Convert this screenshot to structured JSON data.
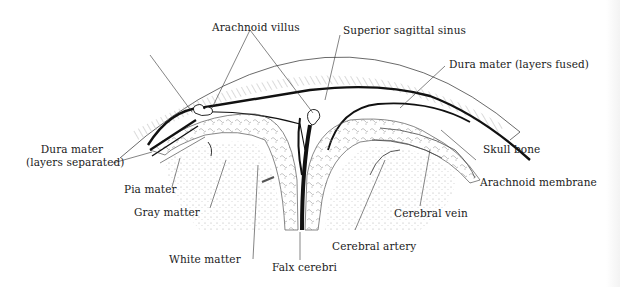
{
  "diagram": {
    "type": "anatomical cross-section",
    "labels": {
      "arachnoid_villus": "Arachnoid villus",
      "superior_sagittal_sinus": "Superior sagittal sinus",
      "dura_mater_fused": "Dura mater (layers fused)",
      "dura_mater_separated_line1": "Dura mater",
      "dura_mater_separated_line2": "(layers separated)",
      "skull_bone": "Skull bone",
      "pia_mater": "Pia mater",
      "arachnoid_membrane": "Arachnoid membrane",
      "gray_matter": "Gray matter",
      "cerebral_vein": "Cerebral vein",
      "cerebral_artery": "Cerebral artery",
      "white_matter": "White matter",
      "falx_cerebri": "Falx cerebri"
    },
    "colors": {
      "ink": "#111111",
      "leader": "#333333",
      "stipple": "#9a9a9a",
      "background": "#ffffff"
    }
  }
}
